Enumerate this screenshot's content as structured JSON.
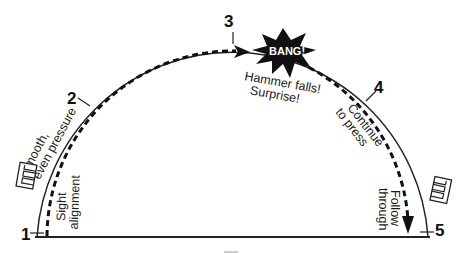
{
  "diagram": {
    "stages": [
      {
        "number": "1",
        "x": 27,
        "y": 240
      },
      {
        "number": "2",
        "x": 74,
        "y": 104
      },
      {
        "number": "3",
        "x": 231,
        "y": 27
      },
      {
        "number": "4",
        "x": 380,
        "y": 93
      },
      {
        "number": "5",
        "x": 438,
        "y": 236
      }
    ],
    "annotations": {
      "smooth_line1": "Smooth,",
      "smooth_line2": "even pressure",
      "sight_line1": "Sight",
      "sight_line2": "alignment",
      "bang": "BANG!",
      "hammer_line1": "Hammer falls!",
      "hammer_line2": "Surprise!",
      "continue_line1": "Continue",
      "continue_line2": "to press",
      "follow_line1": "Follow",
      "follow_line2": "through"
    },
    "icons": {
      "left": "trigger-finger-icon",
      "right": "trigger-finger-icon"
    },
    "colors": {
      "ink": "#111111",
      "background": "#ffffff"
    }
  }
}
